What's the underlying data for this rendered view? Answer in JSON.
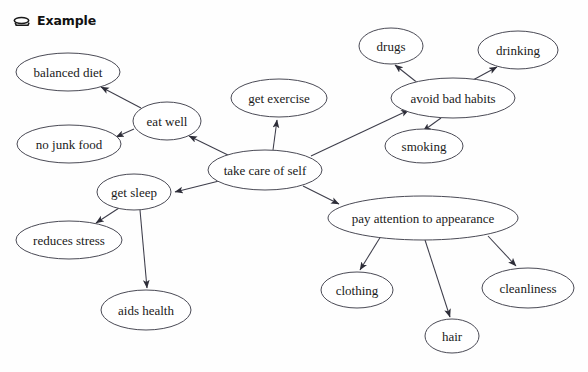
{
  "header": {
    "icon": "oval-shape-icon",
    "title": "Example"
  },
  "canvas": {
    "width": 588,
    "height": 372,
    "background_color": "#fefefe",
    "node_fill": "#ffffff",
    "node_stroke": "#4a4a55",
    "edge_color": "#3d3d4a",
    "text_color": "#1a1a1a"
  },
  "diagram": {
    "type": "concept-map",
    "root": "take care of self",
    "nodes": [
      {
        "id": "take-care-of-self",
        "label": "take care of self",
        "cx": 265,
        "cy": 170,
        "rx": 57,
        "ry": 20,
        "font_size": 13
      },
      {
        "id": "eat-well",
        "label": "eat well",
        "cx": 167,
        "cy": 121,
        "rx": 34,
        "ry": 19,
        "font_size": 13
      },
      {
        "id": "balanced-diet",
        "label": "balanced diet",
        "cx": 68,
        "cy": 72,
        "rx": 52,
        "ry": 19,
        "font_size": 13
      },
      {
        "id": "no-junk-food",
        "label": "no junk food",
        "cx": 69,
        "cy": 144,
        "rx": 52,
        "ry": 19,
        "font_size": 13
      },
      {
        "id": "get-exercise",
        "label": "get exercise",
        "cx": 279,
        "cy": 98,
        "rx": 48,
        "ry": 19,
        "font_size": 13
      },
      {
        "id": "avoid-bad-habits",
        "label": "avoid bad habits",
        "cx": 453,
        "cy": 98,
        "rx": 62,
        "ry": 20,
        "font_size": 13
      },
      {
        "id": "drugs",
        "label": "drugs",
        "cx": 391,
        "cy": 46,
        "rx": 32,
        "ry": 18,
        "font_size": 13
      },
      {
        "id": "drinking",
        "label": "drinking",
        "cx": 518,
        "cy": 50,
        "rx": 40,
        "ry": 19,
        "font_size": 13
      },
      {
        "id": "smoking",
        "label": "smoking",
        "cx": 424,
        "cy": 146,
        "rx": 39,
        "ry": 17,
        "font_size": 13
      },
      {
        "id": "get-sleep",
        "label": "get sleep",
        "cx": 134,
        "cy": 192,
        "rx": 37,
        "ry": 18,
        "font_size": 13
      },
      {
        "id": "reduces-stress",
        "label": "reduces stress",
        "cx": 69,
        "cy": 240,
        "rx": 53,
        "ry": 19,
        "font_size": 13
      },
      {
        "id": "aids-health",
        "label": "aids health",
        "cx": 146,
        "cy": 310,
        "rx": 45,
        "ry": 20,
        "font_size": 13
      },
      {
        "id": "pay-attention-to-appearance",
        "label": "pay attention to appearance",
        "cx": 423,
        "cy": 218,
        "rx": 95,
        "ry": 22,
        "font_size": 13
      },
      {
        "id": "clothing",
        "label": "clothing",
        "cx": 357,
        "cy": 290,
        "rx": 36,
        "ry": 18,
        "font_size": 13
      },
      {
        "id": "hair",
        "label": "hair",
        "cx": 452,
        "cy": 336,
        "rx": 27,
        "ry": 17,
        "font_size": 13
      },
      {
        "id": "cleanliness",
        "label": "cleanliness",
        "cx": 528,
        "cy": 288,
        "rx": 46,
        "ry": 20,
        "font_size": 13
      }
    ],
    "edges": [
      {
        "from": "take-care-of-self",
        "to": "eat-well",
        "x1": 232,
        "y1": 157,
        "x2": 189,
        "y2": 136
      },
      {
        "from": "eat-well",
        "to": "balanced-diet",
        "x1": 141,
        "y1": 108,
        "x2": 101,
        "y2": 87
      },
      {
        "from": "eat-well",
        "to": "no-junk-food",
        "x1": 134,
        "y1": 129,
        "x2": 116,
        "y2": 137
      },
      {
        "from": "take-care-of-self",
        "to": "get-exercise",
        "x1": 273,
        "y1": 150,
        "x2": 277,
        "y2": 120
      },
      {
        "from": "take-care-of-self",
        "to": "avoid-bad-habits",
        "x1": 311,
        "y1": 156,
        "x2": 409,
        "y2": 110
      },
      {
        "from": "avoid-bad-habits",
        "to": "drugs",
        "x1": 419,
        "y1": 84,
        "x2": 395,
        "y2": 65
      },
      {
        "from": "avoid-bad-habits",
        "to": "drinking",
        "x1": 473,
        "y1": 80,
        "x2": 497,
        "y2": 67
      },
      {
        "from": "avoid-bad-habits",
        "to": "smoking",
        "x1": 441,
        "y1": 118,
        "x2": 423,
        "y2": 131
      },
      {
        "from": "take-care-of-self",
        "to": "get-sleep",
        "x1": 219,
        "y1": 181,
        "x2": 175,
        "y2": 192
      },
      {
        "from": "get-sleep",
        "to": "reduces-stress",
        "x1": 119,
        "y1": 208,
        "x2": 96,
        "y2": 223
      },
      {
        "from": "get-sleep",
        "to": "aids-health",
        "x1": 140,
        "y1": 210,
        "x2": 147,
        "y2": 288
      },
      {
        "from": "take-care-of-self",
        "to": "pay-attention-to-appearance",
        "x1": 303,
        "y1": 186,
        "x2": 339,
        "y2": 204
      },
      {
        "from": "pay-attention-to-appearance",
        "to": "clothing",
        "x1": 381,
        "y1": 236,
        "x2": 360,
        "y2": 270
      },
      {
        "from": "pay-attention-to-appearance",
        "to": "hair",
        "x1": 425,
        "y1": 240,
        "x2": 450,
        "y2": 317
      },
      {
        "from": "pay-attention-to-appearance",
        "to": "cleanliness",
        "x1": 488,
        "y1": 236,
        "x2": 516,
        "y2": 266
      }
    ]
  }
}
